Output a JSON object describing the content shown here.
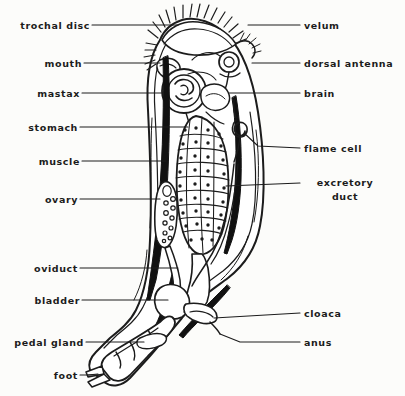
{
  "diagram": {
    "colors": {
      "background": "#fcfcfa",
      "ink": "#1c1c1c",
      "fill": "#ffffff",
      "muscle_dark": "#111111"
    },
    "labels_left": [
      {
        "name": "trochal-disc",
        "text": "trochal disc",
        "x": 8,
        "y": 20,
        "leader_x1": 92,
        "leader_y1": 25,
        "leader_x2": 178,
        "leader_y2": 25
      },
      {
        "name": "mouth",
        "text": "mouth",
        "x": 40,
        "y": 58,
        "leader_x1": 84,
        "leader_y1": 63,
        "leader_x2": 160,
        "leader_y2": 63
      },
      {
        "name": "mastax",
        "text": "mastax",
        "x": 32,
        "y": 88,
        "leader_x1": 82,
        "leader_y1": 93,
        "leader_x2": 163,
        "leader_y2": 93
      },
      {
        "name": "stomach",
        "text": "stomach",
        "x": 26,
        "y": 122,
        "leader_x1": 80,
        "leader_y1": 127,
        "leader_x2": 188,
        "leader_y2": 127
      },
      {
        "name": "muscle",
        "text": "muscle",
        "x": 36,
        "y": 156,
        "leader_x1": 82,
        "leader_y1": 161,
        "leader_x2": 160,
        "leader_y2": 161
      },
      {
        "name": "ovary",
        "text": "ovary",
        "x": 40,
        "y": 194,
        "leader_x1": 80,
        "leader_y1": 199,
        "leader_x2": 156,
        "leader_y2": 199
      },
      {
        "name": "oviduct",
        "text": "oviduct",
        "x": 30,
        "y": 263,
        "leader_x1": 80,
        "leader_y1": 268,
        "leader_x2": 176,
        "leader_y2": 268
      },
      {
        "name": "bladder",
        "text": "bladder",
        "x": 30,
        "y": 295,
        "leader_x1": 82,
        "leader_y1": 300,
        "leader_x2": 166,
        "leader_y2": 300
      },
      {
        "name": "pedal-gland",
        "text": "pedal gland",
        "x": 6,
        "y": 337,
        "leader_x1": 86,
        "leader_y1": 342,
        "leader_x2": 140,
        "leader_y2": 342
      },
      {
        "name": "foot",
        "text": "foot",
        "x": 52,
        "y": 370,
        "leader_x1": 80,
        "leader_y1": 375,
        "leader_x2": 100,
        "leader_y2": 375
      }
    ],
    "labels_right": [
      {
        "name": "velum",
        "text": "velum",
        "x": 306,
        "y": 20,
        "leader_x1": 232,
        "leader_y1": 25,
        "leader_x2": 300,
        "leader_y2": 25
      },
      {
        "name": "dorsal-antenna",
        "text": "dorsal antenna",
        "x": 306,
        "y": 58,
        "leader_x1": 252,
        "leader_y1": 63,
        "leader_x2": 300,
        "leader_y2": 63
      },
      {
        "name": "brain",
        "text": "brain",
        "x": 306,
        "y": 88,
        "leader_x1": 228,
        "leader_y1": 93,
        "leader_x2": 300,
        "leader_y2": 93
      },
      {
        "name": "flame-cell",
        "text": "flame cell",
        "x": 306,
        "y": 143,
        "leader_x1": 238,
        "leader_y1": 148,
        "leader_x2": 300,
        "leader_y2": 148
      },
      {
        "name": "excretory-duct",
        "text": "excretory duct",
        "x": 304,
        "y": 178,
        "leader_x1": 226,
        "leader_y1": 183,
        "leader_x2": 298,
        "leader_y2": 183
      },
      {
        "name": "cloaca",
        "text": "cloaca",
        "x": 306,
        "y": 308,
        "leader_x1": 214,
        "leader_y1": 313,
        "leader_x2": 300,
        "leader_y2": 313
      },
      {
        "name": "anus",
        "text": "anus",
        "x": 306,
        "y": 337,
        "leader_x1": 226,
        "leader_y1": 342,
        "leader_x2": 300,
        "leader_y2": 342
      }
    ],
    "structures": [
      {
        "name": "corona-cilia",
        "count": 16,
        "description": "radiating cilia tufts along top of head"
      },
      {
        "name": "trochal-disc",
        "description": "ciliated anterior disc"
      },
      {
        "name": "velum",
        "description": "ciliated fold at right of corona"
      },
      {
        "name": "mouth",
        "description": "ventral opening below corona"
      },
      {
        "name": "mastax",
        "description": "circular muscular pharynx with internal jaws"
      },
      {
        "name": "dorsal-antenna",
        "description": "small looped sensory antenna on dorsal side"
      },
      {
        "name": "brain",
        "description": "ganglion posterior to antenna"
      },
      {
        "name": "stomach",
        "description": "large oval with grid of cells, each with nucleus dot",
        "cell_rows": 9,
        "cell_cols": 4
      },
      {
        "name": "muscle",
        "description": "long dark retractor muscle band along left body wall"
      },
      {
        "name": "ovary",
        "description": "elongate sac containing oocyte circles",
        "egg_count": 11
      },
      {
        "name": "flame-cell",
        "description": "hooked protonephridial flame cell"
      },
      {
        "name": "excretory-duct",
        "description": "duct descending along right side to bladder"
      },
      {
        "name": "oviduct",
        "description": "duct from ovary toward cloaca"
      },
      {
        "name": "bladder",
        "description": "rounded sac above foot"
      },
      {
        "name": "cloaca",
        "description": "common chamber receiving gut, bladder and oviduct"
      },
      {
        "name": "anus",
        "description": "posterior opening of cloaca"
      },
      {
        "name": "pedal-gland",
        "description": "gland within the foot"
      },
      {
        "name": "foot",
        "description": "segmented foot terminating in two toes",
        "toe_count": 2
      }
    ]
  }
}
